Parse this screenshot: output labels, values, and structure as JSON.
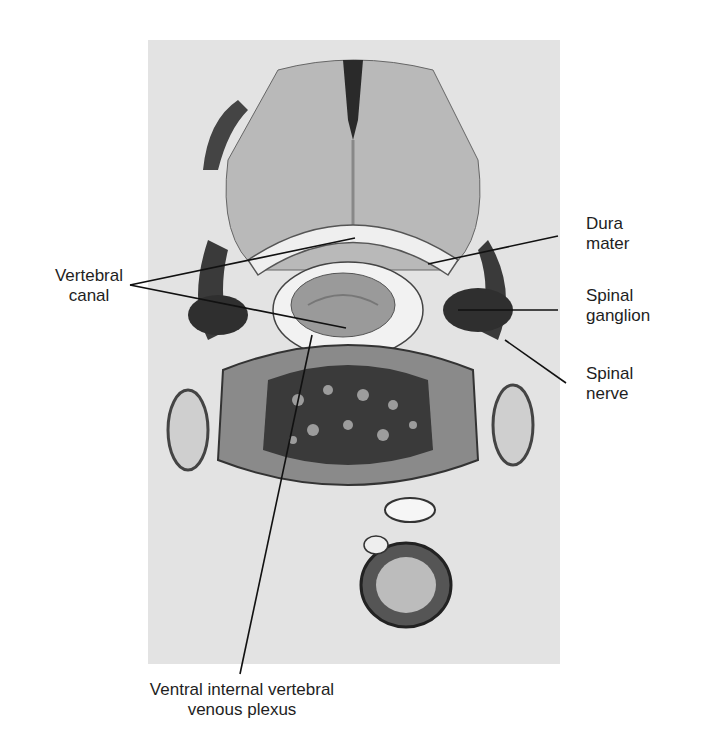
{
  "figure": {
    "labels": {
      "vertebral_canal": {
        "line1": "Vertebral",
        "line2": "canal"
      },
      "dura_mater": {
        "line1": "Dura",
        "line2": "mater"
      },
      "spinal_ganglion": {
        "line1": "Spinal",
        "line2": "ganglion"
      },
      "spinal_nerve": {
        "line1": "Spinal",
        "line2": "nerve"
      },
      "ventral_plexus": {
        "line1": "Ventral internal vertebral",
        "line2": "venous plexus"
      }
    },
    "colors": {
      "background": "#ffffff",
      "photo_base": "#e3e3e3",
      "tissue_dark": "#2a2a2a",
      "tissue_mid": "#7a7a7a",
      "leader_line": "#111111"
    }
  }
}
